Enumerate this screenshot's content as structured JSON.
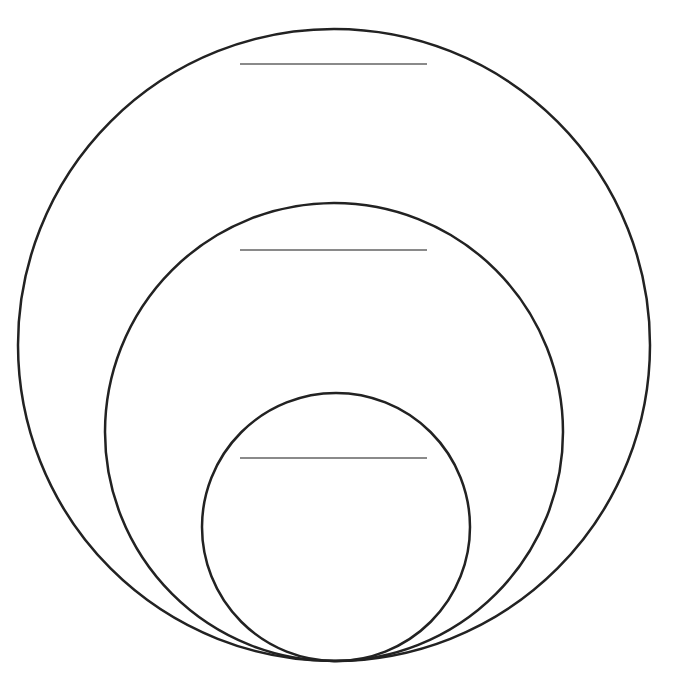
{
  "diagram": {
    "type": "nested-circles",
    "width": 677,
    "height": 687,
    "stroke_color": "#222222",
    "line_color": "#8a8a8a",
    "background": "#ffffff",
    "circles": [
      {
        "name": "outer",
        "cx": 334,
        "cy": 345,
        "r": 316,
        "label_line": {
          "x1": 240,
          "x2": 427,
          "y": 64
        }
      },
      {
        "name": "middle",
        "cx": 334,
        "cy": 432,
        "r": 229,
        "label_line": {
          "x1": 240,
          "x2": 427,
          "y": 250
        }
      },
      {
        "name": "inner",
        "cx": 336,
        "cy": 527,
        "r": 134,
        "label_line": {
          "x1": 240,
          "x2": 427,
          "y": 458
        }
      }
    ]
  }
}
